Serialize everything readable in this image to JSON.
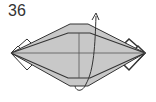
{
  "diagram": {
    "step_number": "36",
    "colors": {
      "paper": "#c8c8c8",
      "line": "#333333",
      "flap": "#ffffff"
    }
  }
}
